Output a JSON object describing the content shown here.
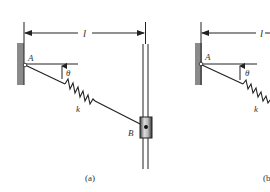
{
  "figure_a": {
    "length_label": "l",
    "point_a_label": "A",
    "angle_label": "θ",
    "spring_label": "k",
    "point_b_label": "B",
    "caption": "(a)"
  },
  "figure_b": {
    "length_label": "l",
    "point_a_label": "A",
    "angle_label": "θ",
    "spring_label": "k",
    "caption": "(b"
  },
  "colors": {
    "wall": "#8a8a8a",
    "line": "#222222",
    "collar": "#555555"
  }
}
